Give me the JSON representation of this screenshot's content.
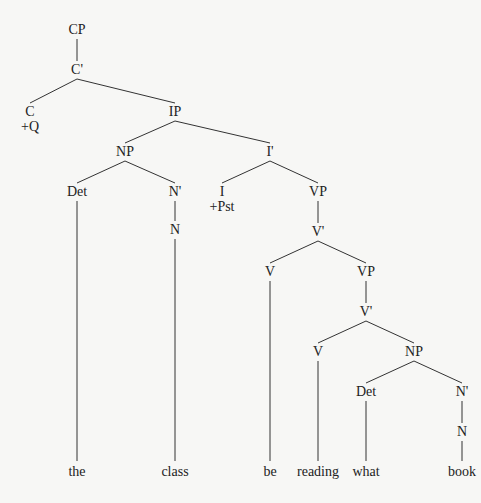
{
  "diagram": {
    "type": "syntax-tree",
    "nodes": [
      {
        "id": "cp",
        "label": "CP",
        "x": 77,
        "y": 22
      },
      {
        "id": "cbar",
        "label": "C'",
        "x": 77,
        "y": 62
      },
      {
        "id": "c",
        "label": "C",
        "x": 30,
        "y": 104,
        "feature": "+Q"
      },
      {
        "id": "ip",
        "label": "IP",
        "x": 175,
        "y": 104
      },
      {
        "id": "np1",
        "label": "NP",
        "x": 125,
        "y": 144
      },
      {
        "id": "det1",
        "label": "Det",
        "x": 77,
        "y": 184
      },
      {
        "id": "nbar1",
        "label": "N'",
        "x": 175,
        "y": 184
      },
      {
        "id": "n1",
        "label": "N",
        "x": 175,
        "y": 222
      },
      {
        "id": "ibar",
        "label": "I'",
        "x": 270,
        "y": 144
      },
      {
        "id": "i",
        "label": "I",
        "x": 222,
        "y": 184,
        "feature": "+Pst"
      },
      {
        "id": "vp1",
        "label": "VP",
        "x": 318,
        "y": 184
      },
      {
        "id": "vbar1",
        "label": "V'",
        "x": 318,
        "y": 224
      },
      {
        "id": "v1",
        "label": "V",
        "x": 270,
        "y": 264
      },
      {
        "id": "vp2",
        "label": "VP",
        "x": 366,
        "y": 264
      },
      {
        "id": "vbar2",
        "label": "V'",
        "x": 366,
        "y": 304
      },
      {
        "id": "v2",
        "label": "V",
        "x": 318,
        "y": 344
      },
      {
        "id": "np2",
        "label": "NP",
        "x": 414,
        "y": 344
      },
      {
        "id": "det2",
        "label": "Det",
        "x": 366,
        "y": 384
      },
      {
        "id": "nbar2",
        "label": "N'",
        "x": 462,
        "y": 384
      },
      {
        "id": "n2",
        "label": "N",
        "x": 462,
        "y": 424
      }
    ],
    "words": [
      {
        "text": "the",
        "x": 77
      },
      {
        "text": "class",
        "x": 175
      },
      {
        "text": "be",
        "x": 270
      },
      {
        "text": "reading",
        "x": 318
      },
      {
        "text": "what",
        "x": 366
      },
      {
        "text": "book",
        "x": 462
      }
    ],
    "words_y": 464,
    "edges": [
      [
        "cp",
        "cbar"
      ],
      [
        "cbar",
        "c"
      ],
      [
        "cbar",
        "ip"
      ],
      [
        "ip",
        "np1"
      ],
      [
        "ip",
        "ibar"
      ],
      [
        "np1",
        "det1"
      ],
      [
        "np1",
        "nbar1"
      ],
      [
        "nbar1",
        "n1"
      ],
      [
        "ibar",
        "i"
      ],
      [
        "ibar",
        "vp1"
      ],
      [
        "vp1",
        "vbar1"
      ],
      [
        "vbar1",
        "v1"
      ],
      [
        "vbar1",
        "vp2"
      ],
      [
        "vp2",
        "vbar2"
      ],
      [
        "vbar2",
        "v2"
      ],
      [
        "vbar2",
        "np2"
      ],
      [
        "np2",
        "det2"
      ],
      [
        "np2",
        "nbar2"
      ],
      [
        "nbar2",
        "n2"
      ]
    ],
    "leaf_edges": [
      [
        "det1",
        0
      ],
      [
        "n1",
        1
      ],
      [
        "v1",
        2
      ],
      [
        "v2",
        3
      ],
      [
        "det2",
        4
      ],
      [
        "n2",
        5
      ]
    ],
    "line_color": "#333333"
  }
}
